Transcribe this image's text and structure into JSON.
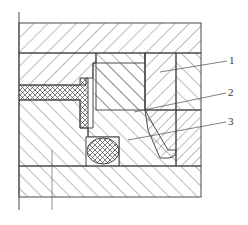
{
  "diagram": {
    "type": "mechanical-seal-cross-section",
    "callouts": [
      {
        "id": "1",
        "label": "1"
      },
      {
        "id": "2",
        "label": "2"
      },
      {
        "id": "3",
        "label": "3"
      }
    ],
    "colors": {
      "line": "#4a4a4a",
      "background": "#ffffff"
    }
  }
}
